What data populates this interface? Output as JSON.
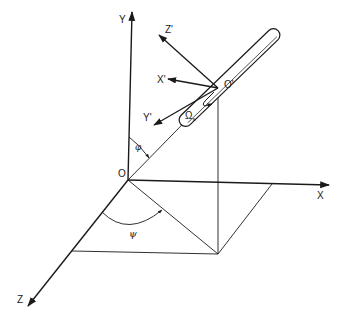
{
  "figure": {
    "type": "3D coordinate frame diagram"
  },
  "labels": {
    "origin": "O",
    "body_origin": "O'",
    "x_axis": "X",
    "y_axis": "Y",
    "z_axis": "Z",
    "x_prime": "X'",
    "y_prime": "Y'",
    "z_prime": "Z'",
    "phi": "φ",
    "psi": "ψ",
    "omega": "Ω",
    "omega_sub": "s"
  },
  "colors": {
    "line": "#1a1a1a",
    "background": "#ffffff"
  }
}
